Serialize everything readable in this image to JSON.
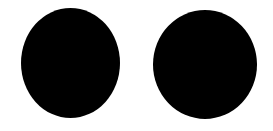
{
  "canvas": {
    "width": 273,
    "height": 131,
    "background_color": "#ffffff",
    "description": "Two solid filled black circles side by side on a plain white background"
  },
  "shapes": [
    {
      "name": "left-circle",
      "kind": "filled-ellipse",
      "fill_color": "#000000",
      "x": 21,
      "y": 8,
      "width": 99,
      "height": 110,
      "center_x": 70.5,
      "center_y": 63,
      "radius_x": 49.5,
      "radius_y": 55
    },
    {
      "name": "right-circle",
      "kind": "filled-ellipse",
      "fill_color": "#000000",
      "x": 153,
      "y": 10,
      "width": 104,
      "height": 109,
      "center_x": 205,
      "center_y": 64.5,
      "radius_x": 52,
      "radius_y": 54.5
    }
  ]
}
